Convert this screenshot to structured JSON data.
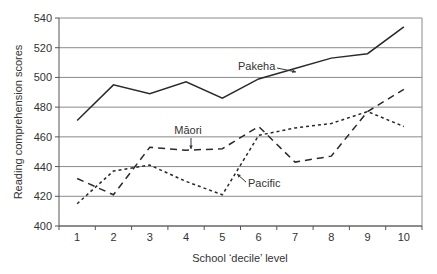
{
  "chart_data": {
    "type": "line",
    "title": "",
    "xlabel": "School ‘decile’ level",
    "ylabel": "Reading comprehension scores",
    "x": [
      1,
      2,
      3,
      4,
      5,
      6,
      7,
      8,
      9,
      10
    ],
    "x_tick_labels": [
      "1",
      "2",
      "3",
      "4",
      "5",
      "6",
      "7",
      "8",
      "9",
      "10"
    ],
    "ylim": [
      400,
      540
    ],
    "y_ticks": [
      400,
      420,
      440,
      460,
      480,
      500,
      520,
      540
    ],
    "y_tick_labels": [
      "400",
      "420",
      "440",
      "460",
      "480",
      "500",
      "520",
      "540"
    ],
    "grid": true,
    "legend": "none (inline annotations)",
    "series": [
      {
        "name": "Pakeha",
        "style": "solid",
        "values": [
          471,
          495,
          489,
          497,
          486,
          499,
          506,
          513,
          516,
          534
        ]
      },
      {
        "name": "Māori",
        "style": "long-dash",
        "values": [
          432,
          421,
          453,
          451,
          452,
          467,
          443,
          447,
          477,
          492
        ]
      },
      {
        "name": "Pacific",
        "style": "short-dash",
        "values": [
          415,
          437,
          441,
          430,
          421,
          461,
          466,
          469,
          477,
          467
        ]
      }
    ],
    "annotations": [
      {
        "text": "Pakeha",
        "series": "Pakeha",
        "points_to_x": 6.6
      },
      {
        "text": "Māori",
        "series": "Māori",
        "points_to_x": 4
      },
      {
        "text": "Pacific",
        "series": "Pacific",
        "points_to_x": 6
      }
    ]
  }
}
